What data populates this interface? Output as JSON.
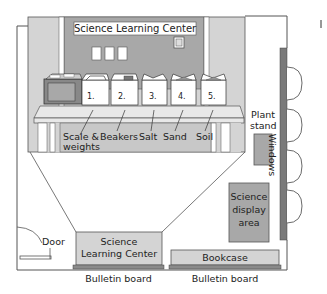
{
  "diagram": {
    "colors": {
      "wall_line": "#555555",
      "light_gray": "#d4d4d4",
      "mid_gray": "#a8a8a8",
      "dark_gray": "#7a7a7a",
      "white": "#ffffff"
    },
    "back_wall": {
      "sign": "Science Learning Center"
    },
    "containers": [
      {
        "number": "1.",
        "label": "Scale &",
        "label2": "weights"
      },
      {
        "number": "2.",
        "label": "Beakers"
      },
      {
        "number": "3.",
        "label": "Salt"
      },
      {
        "number": "4.",
        "label": "Sand"
      },
      {
        "number": "5.",
        "label": "Soil"
      }
    ],
    "room": {
      "plant_stand": {
        "line1": "Plant",
        "line2": "stand"
      },
      "windows": "Windows",
      "science_display": {
        "line1": "Science",
        "line2": "display",
        "line3": "area"
      },
      "door": "Door",
      "learning_center_box": {
        "line1": "Science",
        "line2": "Learning Center"
      },
      "bookcase": "Bookcase",
      "bulletin_board_left": "Bulletin board",
      "bulletin_board_right": "Bulletin board"
    }
  }
}
